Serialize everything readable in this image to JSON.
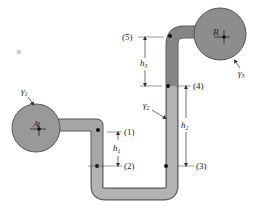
{
  "diagram": {
    "type": "manometer",
    "colors": {
      "background": "#ffffff",
      "tank_fill": "#8f8f8f",
      "tank_stroke": "#555555",
      "pipe_fill": "#a3a3a3",
      "heavy_fluid": "#7d7d7d",
      "light_fluid": "#b9b9b9",
      "dimension_line": "#333333",
      "point": "#111111"
    },
    "tanks": [
      {
        "id": "A",
        "label": "A",
        "fluid_label": "γ1",
        "fluid_sub": "1"
      },
      {
        "id": "B",
        "label": "B",
        "fluid_label": "γ3",
        "fluid_sub": "3"
      }
    ],
    "manometer_fluid": {
      "label": "γ2",
      "sub": "2"
    },
    "points": [
      {
        "id": "1",
        "label": "(1)"
      },
      {
        "id": "2",
        "label": "(2)"
      },
      {
        "id": "3",
        "label": "(3)"
      },
      {
        "id": "4",
        "label": "(4)"
      },
      {
        "id": "5",
        "label": "(5)"
      }
    ],
    "dimensions": [
      {
        "id": "h1",
        "label": "h",
        "sub": "1",
        "between": [
          "1",
          "2"
        ]
      },
      {
        "id": "h2",
        "label": "h",
        "sub": "2",
        "between": [
          "4",
          "3"
        ]
      },
      {
        "id": "h3",
        "label": "h",
        "sub": "3",
        "between": [
          "5",
          "4"
        ]
      }
    ]
  }
}
